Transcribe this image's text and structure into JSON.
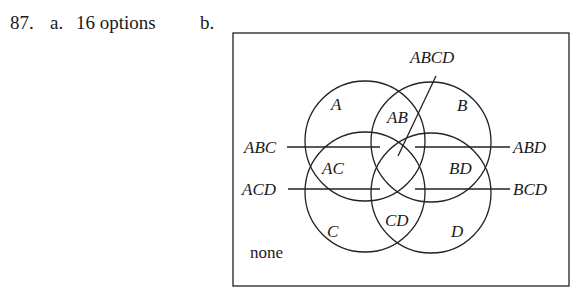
{
  "question": {
    "number": "87.",
    "part_a_label": "a.",
    "part_a_answer": "16 options",
    "part_b_label": "b."
  },
  "diagram": {
    "sets": [
      "A",
      "B",
      "C",
      "D"
    ],
    "region_labels": {
      "A": "A",
      "B": "B",
      "C": "C",
      "D": "D",
      "AB": "AB",
      "AC": "AC",
      "BD": "BD",
      "CD": "CD",
      "none": "none"
    },
    "callout_labels": {
      "ABCD": "ABCD",
      "ABC": "ABC",
      "ABD": "ABD",
      "ACD": "ACD",
      "BCD": "BCD"
    }
  }
}
